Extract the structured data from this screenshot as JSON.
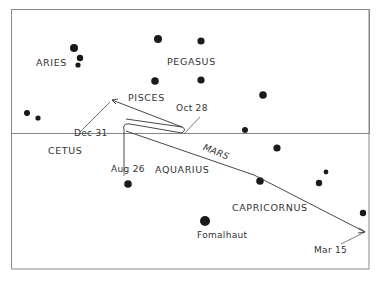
{
  "constellations": [
    {
      "id": "aries",
      "label": "ARIES"
    },
    {
      "id": "pegasus",
      "label": "PEGASUS"
    },
    {
      "id": "pisces",
      "label": "PISCES"
    },
    {
      "id": "cetus",
      "label": "CETUS"
    },
    {
      "id": "aquarius",
      "label": "AQUARIUS"
    },
    {
      "id": "capricornus",
      "label": "CAPRICORNUS"
    }
  ],
  "stars": [
    {
      "name": "Fomalhaut",
      "label": "Fomalhaut"
    }
  ],
  "path": {
    "label": "MARS",
    "dates": {
      "aug": "Aug 26",
      "oct": "Oct 28",
      "dec": "Dec 31",
      "mar": "Mar 15"
    }
  },
  "colors": {
    "ink": "#222222",
    "frame": "#666666",
    "background": "#ffffff"
  }
}
